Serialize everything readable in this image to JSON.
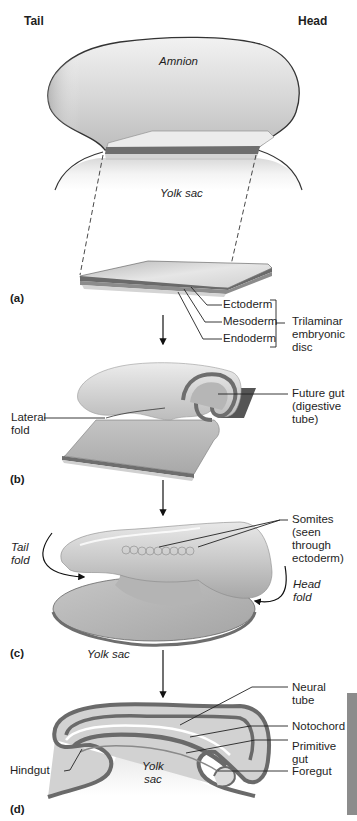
{
  "orientation": {
    "left": "Tail",
    "right": "Head"
  },
  "panels": {
    "a": {
      "label": "(a)",
      "amnion": "Amnion",
      "yolk_sac": "Yolk sac",
      "layers": [
        "Ectoderm",
        "Mesoderm",
        "Endoderm"
      ],
      "bracket_label": [
        "Trilaminar",
        "embryonic",
        "disc"
      ]
    },
    "b": {
      "label": "(b)",
      "lateral_fold": [
        "Lateral",
        "fold"
      ],
      "future_gut": [
        "Future gut",
        "(digestive",
        "tube)"
      ]
    },
    "c": {
      "label": "(c)",
      "tail_fold": [
        "Tail",
        "fold"
      ],
      "head_fold": [
        "Head",
        "fold"
      ],
      "somites": [
        "Somites",
        "(seen",
        "through",
        "ectoderm)"
      ],
      "yolk_sac": "Yolk sac"
    },
    "d": {
      "label": "(d)",
      "neural_tube": [
        "Neural",
        "tube"
      ],
      "notochord": "Notochord",
      "primitive_gut": [
        "Primitive",
        "gut"
      ],
      "foregut": "Foregut",
      "hindgut": "Hindgut",
      "yolk_sac": [
        "Yolk",
        "sac"
      ]
    }
  },
  "colors": {
    "ectoderm": "#c8c8c8",
    "mesoderm": "#6e6e6e",
    "endoderm": "#a9a9a9",
    "outline": "#333333",
    "side_tab": "#8c8c8c"
  }
}
